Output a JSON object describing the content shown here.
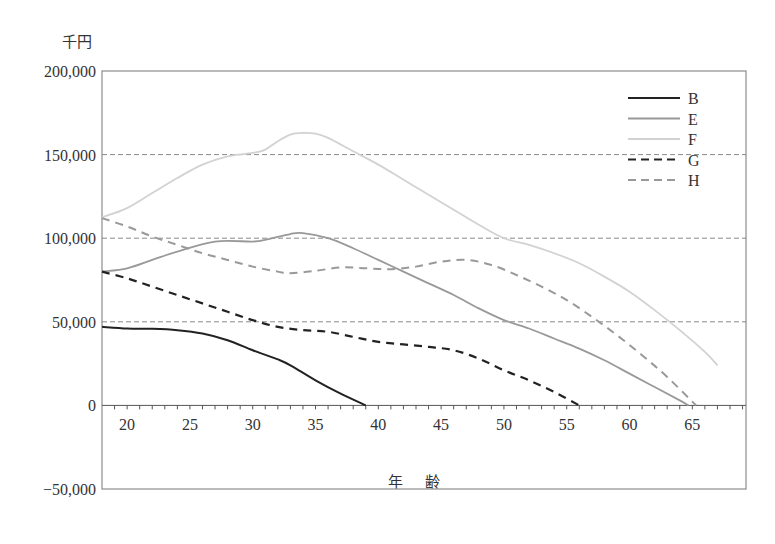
{
  "chart_data": {
    "type": "line",
    "title": "",
    "xlabel": "年　齢",
    "ylabel": "千円",
    "xlim": [
      18,
      69
    ],
    "ylim": [
      -50000,
      200000
    ],
    "xticks": [
      20,
      25,
      30,
      35,
      40,
      45,
      50,
      55,
      60,
      65
    ],
    "yticks": [
      -50000,
      0,
      50000,
      100000,
      150000,
      200000
    ],
    "ytick_labels": [
      "−50,000",
      "0",
      "50,000",
      "100,000",
      "150,000",
      "200,000"
    ],
    "grid": {
      "horizontal_dashed_at": [
        50000,
        100000,
        150000
      ]
    },
    "legend": {
      "position": "upper right",
      "entries": [
        "B",
        "E",
        "F",
        "G",
        "H"
      ]
    },
    "series": [
      {
        "name": "B",
        "style": "solid",
        "color": "#222222",
        "x": [
          18,
          20,
          22,
          24,
          26,
          28,
          30,
          32,
          33,
          35,
          37,
          39
        ],
        "y": [
          47000,
          46000,
          45800,
          45000,
          43000,
          39000,
          33000,
          27500,
          24000,
          15000,
          7000,
          0
        ]
      },
      {
        "name": "E",
        "style": "solid",
        "color": "#999999",
        "x": [
          18,
          20,
          22,
          24,
          27,
          30,
          31,
          33,
          34,
          36,
          38,
          40,
          42,
          44,
          46,
          48,
          50,
          52,
          54,
          56,
          58,
          60,
          62,
          64,
          64.7
        ],
        "y": [
          80000,
          82000,
          87000,
          92000,
          98000,
          98000,
          99000,
          102500,
          103000,
          100000,
          94000,
          87000,
          80000,
          73000,
          66000,
          58000,
          51000,
          46000,
          40000,
          34000,
          27000,
          19000,
          11000,
          3000,
          0
        ]
      },
      {
        "name": "F",
        "style": "solid",
        "color": "#d2d2d2",
        "x": [
          18,
          20,
          22,
          24,
          26,
          28,
          30,
          31,
          32,
          33,
          34,
          35,
          36,
          38,
          40,
          42,
          44,
          46,
          48,
          50,
          52,
          54,
          56,
          58,
          60,
          62,
          64,
          66,
          67
        ],
        "y": [
          112500,
          118000,
          127000,
          136000,
          144000,
          149000,
          151000,
          153000,
          158000,
          162000,
          163000,
          162500,
          160000,
          152000,
          144000,
          135000,
          126000,
          117000,
          108000,
          100000,
          96000,
          91000,
          85000,
          77000,
          68000,
          57000,
          45000,
          32000,
          24000
        ]
      },
      {
        "name": "G",
        "style": "dashed",
        "color": "#222222",
        "x": [
          18,
          20,
          22,
          24,
          26,
          28,
          30,
          32,
          34,
          36,
          38,
          40,
          42,
          44,
          46,
          48,
          50,
          52,
          54,
          56
        ],
        "y": [
          80000,
          76000,
          71000,
          66000,
          61000,
          56000,
          51000,
          47000,
          45000,
          44000,
          41000,
          38000,
          36500,
          35000,
          33000,
          28000,
          21000,
          15000,
          8000,
          0
        ]
      },
      {
        "name": "H",
        "style": "dashed",
        "color": "#999999",
        "x": [
          18,
          20,
          22,
          24,
          26,
          28,
          30,
          32,
          33,
          35,
          37,
          39,
          41,
          43,
          45,
          47,
          49,
          51,
          53,
          55,
          57,
          59,
          61,
          63,
          65.3
        ],
        "y": [
          112000,
          107000,
          101000,
          96000,
          91000,
          87000,
          83000,
          80000,
          79000,
          80500,
          82500,
          82000,
          81500,
          83000,
          86000,
          87000,
          84000,
          78000,
          71000,
          63000,
          53000,
          42000,
          30000,
          17000,
          0
        ]
      }
    ]
  },
  "labels": {
    "y_unit": "千円",
    "x_title": "年齢"
  }
}
